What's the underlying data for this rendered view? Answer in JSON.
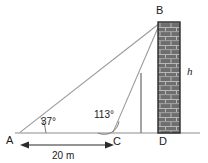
{
  "figure": {
    "type": "geometry-diagram",
    "background_color": "#ffffff",
    "line_color": "#8c8c8c",
    "dark_line_color": "#4d4d4d",
    "text_color": "#1a1a1a",
    "wall_fill": "#6b6b6b",
    "wall_mortar": "#b0b0b0",
    "wall_border": "#2b2b2b"
  },
  "labels": {
    "point_a": "A",
    "point_b": "B",
    "point_c": "C",
    "point_d": "D",
    "angle_a": "37°",
    "angle_c": "113°",
    "height": "h",
    "distance": "20 m"
  },
  "geometry": {
    "baseline_y": 133,
    "baseline_x_start": 15,
    "baseline_x_end": 200,
    "a": {
      "x": 20,
      "y": 133
    },
    "b": {
      "x": 159,
      "y": 23
    },
    "c": {
      "x": 113,
      "y": 133
    },
    "d": {
      "x": 159,
      "y": 133
    },
    "wall": {
      "x": 158,
      "y": 22,
      "width": 22,
      "height": 111
    },
    "inner_vertical": {
      "x": 141,
      "y_top": 73,
      "y_bottom": 133
    },
    "dimension_arrow": {
      "y": 145,
      "x_start": 22,
      "x_end": 112
    }
  },
  "measurements": {
    "angle_at_a_degrees": 37,
    "angle_at_c_degrees": 113,
    "distance_ac_meters": 20,
    "unknown": "h"
  }
}
